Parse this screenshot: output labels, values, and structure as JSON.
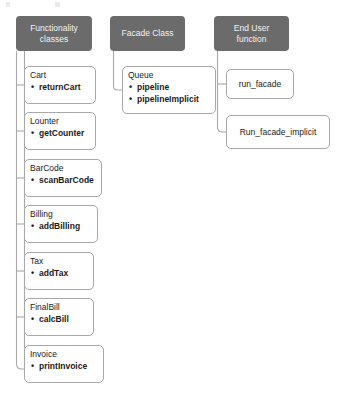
{
  "diagram": {
    "colors": {
      "header_fill": "#6b6b6b",
      "header_text": "#f2f2f2",
      "node_border": "#a8a8a8",
      "node_fill": "#ffffff",
      "connector": "#a8a8a8",
      "text": "#1a1a1a"
    },
    "columns": [
      {
        "id": "functionality",
        "header": "Functionality\nclasses",
        "nodes": [
          {
            "title": "Cart",
            "members": [
              "returnCart"
            ]
          },
          {
            "title": "Lounter",
            "members": [
              "getCounter"
            ]
          },
          {
            "title": "BarCode",
            "members": [
              "scanBarCode"
            ]
          },
          {
            "title": "Billing",
            "members": [
              "addBilling"
            ]
          },
          {
            "title": "Tax",
            "members": [
              "addTax"
            ]
          },
          {
            "title": "FinalBill",
            "members": [
              "calcBill"
            ]
          },
          {
            "title": "Invoice",
            "members": [
              "printInvoice"
            ]
          }
        ]
      },
      {
        "id": "facade",
        "header": "Facade Class",
        "nodes": [
          {
            "title": "Queue",
            "members": [
              "pipeline",
              "pipelineImplicit"
            ]
          }
        ]
      },
      {
        "id": "enduser",
        "header": "End User\nfunction",
        "nodes": [
          {
            "title": "run_facade",
            "members": []
          },
          {
            "title": "Run_facade_implicit",
            "members": []
          }
        ]
      }
    ]
  }
}
